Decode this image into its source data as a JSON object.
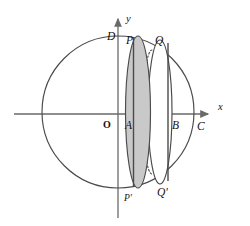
{
  "figure": {
    "colors": {
      "stroke": "#3a3a3a",
      "axis": "#6a6a6a",
      "shade_fill": "#c9c9c9",
      "white_fill": "#ffffff",
      "label": "#111111"
    },
    "axes": {
      "x_label": "x",
      "y_label": "y",
      "origin_label": "O",
      "origin": {
        "x": 118,
        "y": 114
      },
      "x_arrow_tip": {
        "x": 214,
        "y": 114
      },
      "y_arrow_tip": {
        "x": 118,
        "y": 13
      }
    },
    "circle": {
      "cx": 118,
      "cy": 112,
      "r": 76,
      "name": "great-circle"
    },
    "ellipses": [
      {
        "name": "shaded-ellipse",
        "cx": 138,
        "cy": 112,
        "rx": 12,
        "ry": 76,
        "fill": "#c9c9c9",
        "top_label": "P",
        "bottom_label": "P'"
      },
      {
        "name": "white-ellipse",
        "cx": 160,
        "cy": 112,
        "rx": 12,
        "ry": 72,
        "fill": "#ffffff",
        "top_label": "Q",
        "bottom_label": "Q'"
      }
    ],
    "chords": [
      {
        "name": "chord-PA",
        "x": 133,
        "y1": 36,
        "y2": 188,
        "label": "A"
      },
      {
        "name": "chord-QB",
        "x": 168,
        "y1": 42,
        "y2": 182,
        "label": "B"
      }
    ],
    "dotted_arc": {
      "name": "hidden-back-arc",
      "cx": 152,
      "cy": 112,
      "rx": 8,
      "ry": 62
    },
    "points": [
      {
        "id": "D",
        "label": "D",
        "x": 107,
        "y": 40,
        "name": "point-label-d"
      },
      {
        "id": "P",
        "label": "P",
        "x": 126,
        "y": 44,
        "name": "point-label-p"
      },
      {
        "id": "Q",
        "label": "Q",
        "x": 155,
        "y": 44,
        "name": "point-label-q"
      },
      {
        "id": "O",
        "label": "O",
        "x": 103,
        "y": 128,
        "name": "point-label-o"
      },
      {
        "id": "A",
        "label": "A",
        "x": 125,
        "y": 129,
        "name": "point-label-a"
      },
      {
        "id": "B",
        "label": "B",
        "x": 172,
        "y": 129,
        "name": "point-label-b"
      },
      {
        "id": "C",
        "label": "C",
        "x": 197,
        "y": 130,
        "name": "point-label-c"
      },
      {
        "id": "Pp",
        "label": "P'",
        "x": 124,
        "y": 201,
        "name": "point-label-p-prime"
      },
      {
        "id": "Qp",
        "label": "Q'",
        "x": 157,
        "y": 196,
        "name": "point-label-q-prime"
      }
    ]
  }
}
